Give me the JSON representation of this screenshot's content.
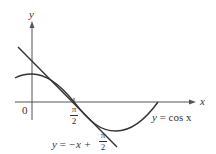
{
  "diagram": {
    "axes": {
      "x_label": "x",
      "y_label": "y",
      "origin_label": "0",
      "tick_label_numerator": "π",
      "tick_label_denominator": "2"
    },
    "curves": [
      {
        "name": "cosine",
        "label_lhs": "y",
        "label_eq": "=",
        "label_rhs": "cos x"
      },
      {
        "name": "tangent-line",
        "label_lhs": "y",
        "label_eq": "=",
        "label_rhs": "−x +",
        "label_frac_num": "π",
        "label_frac_den": "2"
      }
    ],
    "colors": {
      "axes": "#555555",
      "curve": "#333333",
      "text": "#333333",
      "background": "#ffffff"
    }
  }
}
